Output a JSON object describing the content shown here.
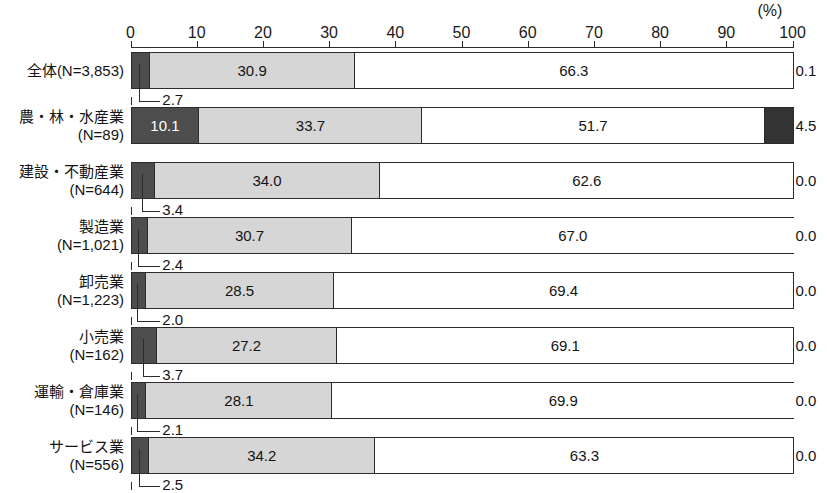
{
  "axis": {
    "unit_label": "(%)",
    "ticks": [
      0,
      10,
      20,
      30,
      40,
      50,
      60,
      70,
      80,
      90,
      100
    ],
    "tick_labels": [
      "0",
      "10",
      "20",
      "30",
      "40",
      "50",
      "60",
      "70",
      "80",
      "90",
      "100"
    ],
    "min": 0,
    "max": 100
  },
  "colors": {
    "series1": "#4d4d4d",
    "series2": "#d6d6d6",
    "series3": "#ffffff",
    "series4": "#333333",
    "outline": "#2b2b2b",
    "text": "#141414"
  },
  "rows": [
    {
      "label_lines": [
        "全体(N=3,853)"
      ],
      "values": [
        2.7,
        30.9,
        66.3,
        0.1
      ],
      "value_texts": [
        "2.7",
        "30.9",
        "66.3",
        "0.1"
      ]
    },
    {
      "label_lines": [
        "農・林・水産業",
        "(N=89)"
      ],
      "values": [
        10.1,
        33.7,
        51.7,
        4.5
      ],
      "value_texts": [
        "10.1",
        "33.7",
        "51.7",
        "4.5"
      ]
    },
    {
      "label_lines": [
        "建設・不動産業",
        "(N=644)"
      ],
      "values": [
        3.4,
        34.0,
        62.6,
        0.0
      ],
      "value_texts": [
        "3.4",
        "34.0",
        "62.6",
        "0.0"
      ]
    },
    {
      "label_lines": [
        "製造業",
        "(N=1,021)"
      ],
      "values": [
        2.4,
        30.7,
        67.0,
        0.0
      ],
      "value_texts": [
        "2.4",
        "30.7",
        "67.0",
        "0.0"
      ]
    },
    {
      "label_lines": [
        "卸売業",
        "(N=1,223)"
      ],
      "values": [
        2.0,
        28.5,
        69.4,
        0.0
      ],
      "value_texts": [
        "2.0",
        "28.5",
        "69.4",
        "0.0"
      ]
    },
    {
      "label_lines": [
        "小売業",
        "(N=162)"
      ],
      "values": [
        3.7,
        27.2,
        69.1,
        0.0
      ],
      "value_texts": [
        "3.7",
        "27.2",
        "69.1",
        "0.0"
      ]
    },
    {
      "label_lines": [
        "運輸・倉庫業",
        "(N=146)"
      ],
      "values": [
        2.1,
        28.1,
        69.9,
        0.0
      ],
      "value_texts": [
        "2.1",
        "28.1",
        "69.9",
        "0.0"
      ]
    },
    {
      "label_lines": [
        "サービス業",
        "(N=556)"
      ],
      "values": [
        2.5,
        34.2,
        63.3,
        0.0
      ],
      "value_texts": [
        "2.5",
        "34.2",
        "63.3",
        "0.0"
      ]
    }
  ],
  "chart_data": {
    "type": "bar",
    "orientation": "horizontal",
    "stacked": true,
    "normalized_percent": true,
    "title": "",
    "xlabel": "(%)",
    "ylabel": "",
    "xlim": [
      0,
      100
    ],
    "xticks": [
      0,
      10,
      20,
      30,
      40,
      50,
      60,
      70,
      80,
      90,
      100
    ],
    "grid": false,
    "legend": "none",
    "categories": [
      "全体(N=3,853)",
      "農・林・水産業(N=89)",
      "建設・不動産業(N=644)",
      "製造業(N=1,021)",
      "卸売業(N=1,223)",
      "小売業(N=162)",
      "運輸・倉庫業(N=146)",
      "サービス業(N=556)"
    ],
    "series": [
      {
        "name": "series-1",
        "color": "#4d4d4d",
        "values": [
          2.7,
          10.1,
          3.4,
          2.4,
          2.0,
          3.7,
          2.1,
          2.5
        ]
      },
      {
        "name": "series-2",
        "color": "#d6d6d6",
        "values": [
          30.9,
          33.7,
          34.0,
          30.7,
          28.5,
          27.2,
          28.1,
          34.2
        ]
      },
      {
        "name": "series-3",
        "color": "#ffffff",
        "values": [
          66.3,
          51.7,
          62.6,
          67.0,
          69.4,
          69.1,
          69.9,
          63.3
        ]
      },
      {
        "name": "series-4",
        "color": "#333333",
        "values": [
          0.1,
          4.5,
          0.0,
          0.0,
          0.0,
          0.0,
          0.0,
          0.0
        ]
      }
    ]
  }
}
